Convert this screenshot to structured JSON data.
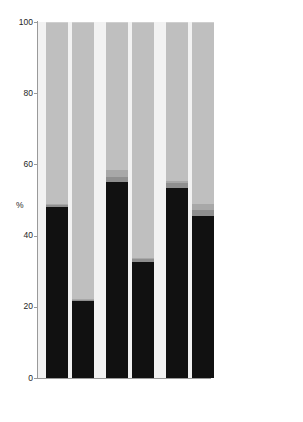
{
  "chart_data": {
    "type": "bar",
    "subtype": "stacked-percentage",
    "title": "",
    "xlabel": "",
    "ylabel": "%",
    "ylim": [
      0,
      100
    ],
    "yticks": [
      0,
      20,
      40,
      60,
      80,
      100
    ],
    "ytick_labels": [
      "0",
      "20",
      "40",
      "60",
      "80",
      "100"
    ],
    "grid": false,
    "legend_position": "right",
    "categories": [
      "M",
      "S",
      "M",
      "S",
      "M",
      "S"
    ],
    "groups": [
      "subject A",
      "subject B",
      "subject C"
    ],
    "group_labels": [
      {
        "label": "subject A",
        "members": [
          "M",
          "S"
        ]
      },
      {
        "label": "subject B",
        "members": [
          "M",
          "S"
        ]
      },
      {
        "label": "subject C",
        "members": [
          "M",
          "S"
        ]
      }
    ],
    "series": [
      {
        "name": "Bacteroidetes",
        "color": "#111111",
        "values": [
          48.0,
          21.5,
          55.0,
          32.5,
          53.5,
          45.5
        ]
      },
      {
        "name": "Proteobacteria",
        "color": "#8f8f8f",
        "values": [
          0.6,
          0.4,
          1.5,
          0.8,
          1.3,
          1.8
        ]
      },
      {
        "name": "Verrucomicrobia",
        "color": "#a8a8a8",
        "values": [
          0.4,
          0.3,
          1.8,
          0.4,
          0.5,
          1.6
        ]
      },
      {
        "name": "Firmicutes",
        "color": "#bfbfbf",
        "values": [
          50.8,
          77.6,
          41.5,
          66.1,
          44.5,
          50.9
        ]
      },
      {
        "name": "other",
        "color": "#cfcfcf",
        "values": [
          0.2,
          0.2,
          0.2,
          0.2,
          0.2,
          0.2
        ]
      }
    ],
    "stack_order_bottom_to_top": [
      "Bacteroidetes",
      "Proteobacteria",
      "Verrucomicrobia",
      "Firmicutes",
      "other"
    ],
    "bars": [
      {
        "group": "subject A",
        "sample": "M",
        "Bacteroidetes": 48.0,
        "Proteobacteria": 0.6,
        "Verrucomicrobia": 0.4,
        "Firmicutes": 50.8,
        "other": 0.2
      },
      {
        "group": "subject A",
        "sample": "S",
        "Bacteroidetes": 21.5,
        "Proteobacteria": 0.4,
        "Verrucomicrobia": 0.3,
        "Firmicutes": 77.6,
        "other": 0.2
      },
      {
        "group": "subject B",
        "sample": "M",
        "Bacteroidetes": 55.0,
        "Proteobacteria": 1.5,
        "Verrucomicrobia": 1.8,
        "Firmicutes": 41.5,
        "other": 0.2
      },
      {
        "group": "subject B",
        "sample": "S",
        "Bacteroidetes": 32.5,
        "Proteobacteria": 0.8,
        "Verrucomicrobia": 0.4,
        "Firmicutes": 66.1,
        "other": 0.2
      },
      {
        "group": "subject C",
        "sample": "M",
        "Bacteroidetes": 53.5,
        "Proteobacteria": 1.3,
        "Verrucomicrobia": 0.5,
        "Firmicutes": 44.5,
        "other": 0.2
      },
      {
        "group": "subject C",
        "sample": "S",
        "Bacteroidetes": 45.5,
        "Proteobacteria": 1.8,
        "Verrucomicrobia": 1.6,
        "Firmicutes": 50.9,
        "other": 0.2
      }
    ]
  },
  "legend": {
    "items": [
      {
        "label": "Firmicutes",
        "color": "#bfbfbf",
        "italic": true
      },
      {
        "label": "Verrucomicrobia",
        "color": "#a8a8a8",
        "italic": true
      },
      {
        "label": "Proteobacteria",
        "color": "#8f8f8f",
        "italic": true
      },
      {
        "label": "Bacteroidetes",
        "color": "#111111",
        "italic": true
      },
      {
        "label": "other",
        "color": "#cfcfcf",
        "italic": false
      }
    ]
  },
  "axis": {
    "y_title": "%",
    "y_labels": [
      "100",
      "80",
      "60",
      "40",
      "20",
      "0"
    ],
    "x_sample_labels": [
      "M",
      "S",
      "M",
      "S",
      "M",
      "S"
    ],
    "x_group_labels": [
      "subject A",
      "subject B",
      "subject C"
    ]
  },
  "colors": {
    "plot_background": "#f2f2f2",
    "page_background": "#ffffff",
    "axis": "#9a9a9a",
    "text": "#1e1e1e"
  }
}
